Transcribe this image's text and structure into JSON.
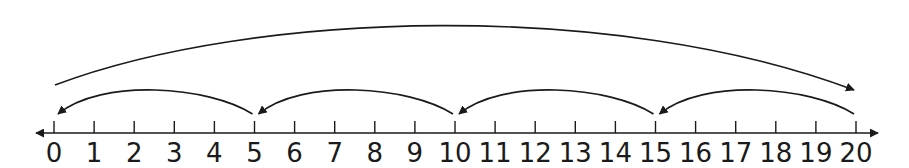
{
  "diagram": {
    "type": "number-line",
    "min": 0,
    "max": 20,
    "step": 1,
    "tick_labels": [
      "0",
      "1",
      "2",
      "3",
      "4",
      "5",
      "6",
      "7",
      "8",
      "9",
      "10",
      "11",
      "12",
      "13",
      "14",
      "15",
      "16",
      "17",
      "18",
      "19",
      "20"
    ],
    "line_color": "#1a1a1a",
    "jumps": [
      {
        "from": 0,
        "to": 20,
        "direction": "right",
        "level": "top"
      },
      {
        "from": 20,
        "to": 15,
        "direction": "left",
        "level": "lower"
      },
      {
        "from": 15,
        "to": 10,
        "direction": "left",
        "level": "lower"
      },
      {
        "from": 10,
        "to": 5,
        "direction": "left",
        "level": "lower"
      },
      {
        "from": 5,
        "to": 0,
        "direction": "left",
        "level": "lower"
      }
    ]
  }
}
